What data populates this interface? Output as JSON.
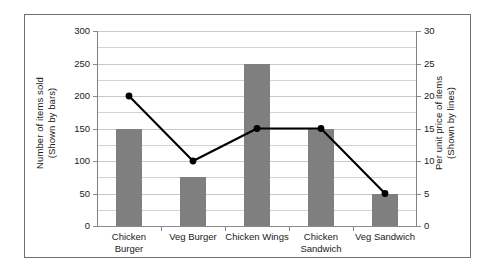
{
  "chart_data": {
    "type": "bar",
    "title": "",
    "subtitle": "",
    "categories": [
      "Chicken Burger",
      "Veg Burger",
      "Chicken Wings",
      "Chicken Sandwich",
      "Veg Sandwich"
    ],
    "series": [
      {
        "name": "Number of items sold (Shown by bars)",
        "type": "bar",
        "axis": "left",
        "values": [
          150,
          75,
          250,
          150,
          50
        ],
        "color": "#7f7f7f"
      },
      {
        "name": "Per unit price of items (Shown by lines)",
        "type": "line",
        "axis": "right",
        "values": [
          20,
          10,
          15,
          15,
          5
        ],
        "color": "#000000",
        "marker": "circle"
      }
    ],
    "xlabel": "",
    "ylabel": "Number of items sold (Shown by bars)",
    "y2label": "Per unit price of items (Shown by lines)",
    "ylim": [
      0,
      300
    ],
    "y2lim": [
      0,
      30
    ],
    "yticks": [
      0,
      50,
      100,
      150,
      200,
      250,
      300
    ],
    "y2ticks": [
      0,
      5,
      10,
      15,
      20,
      25,
      30
    ],
    "grid": true,
    "grid_minor_step": 25,
    "legend": "none"
  },
  "axes": {
    "left_title_line1": "Number of items sold",
    "left_title_line2": "(Shown by bars)",
    "right_title_line1": "Per unit price of items",
    "right_title_line2": "(Shown by lines)",
    "left_ticks": [
      "0",
      "50",
      "100",
      "150",
      "200",
      "250",
      "300"
    ],
    "right_ticks": [
      "0",
      "5",
      "10",
      "15",
      "20",
      "25",
      "30"
    ]
  },
  "categories": [
    {
      "line1": "Chicken Burger",
      "line2": ""
    },
    {
      "line1": "Veg Burger",
      "line2": ""
    },
    {
      "line1": "Chicken Wings",
      "line2": ""
    },
    {
      "line1": "Chicken",
      "line2": "Sandwich"
    },
    {
      "line1": "Veg Sandwich",
      "line2": ""
    }
  ],
  "colors": {
    "bar_fill": "#7f7f7f",
    "line_stroke": "#000000",
    "gridline": "#d2d2d2",
    "axis": "#8a8a8a",
    "frame_border": "#6f6f6f",
    "background": "#ffffff",
    "text": "#1a1a1a"
  }
}
